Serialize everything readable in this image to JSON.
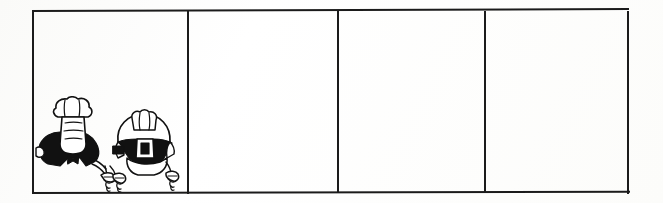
{
  "document": {
    "kind": "scanned-comic-strip",
    "title": "Blank four-panel comic strip",
    "background_color": "#fdfdfd",
    "ink_color": "#1b1b1b",
    "width_px": 663,
    "height_px": 203
  },
  "strip": {
    "panel_count": 4,
    "frame": {
      "left_px": 32,
      "top_px": 10,
      "width_px": 597,
      "height_px": 184,
      "border_color": "#1b1b1b",
      "border_width_px": 2
    },
    "panels": [
      {
        "index": 1,
        "label": "Panel 1",
        "caption": "",
        "dialogue": "",
        "has_artwork": true,
        "artwork_name": "two-robed-figures-holding-ropes",
        "artwork_description": "Black and white line drawing of two cartoon figures in dark capes with white wigs, each gripping a twisted rope in their hands"
      },
      {
        "index": 2,
        "label": "Panel 2",
        "caption": "",
        "dialogue": "",
        "has_artwork": false,
        "artwork_name": "",
        "artwork_description": ""
      },
      {
        "index": 3,
        "label": "Panel 3",
        "caption": "",
        "dialogue": "",
        "has_artwork": false,
        "artwork_name": "",
        "artwork_description": ""
      },
      {
        "index": 4,
        "label": "Panel 4",
        "caption": "",
        "dialogue": "",
        "has_artwork": false,
        "artwork_name": "",
        "artwork_description": ""
      }
    ],
    "dividers": [
      {
        "index": 1,
        "x_px": 155
      },
      {
        "index": 2,
        "x_px": 305
      },
      {
        "index": 3,
        "x_px": 452
      }
    ]
  }
}
